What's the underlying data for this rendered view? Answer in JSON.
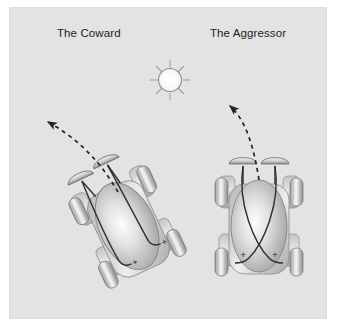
{
  "figure": {
    "kind": "diagram",
    "background_color": "#ffffff",
    "panel_color": "#e3e3e3",
    "panel_border_color": "#dcdcdc",
    "ink_color": "#1d1d1d"
  },
  "labels": {
    "left_vehicle": "The Coward",
    "right_vehicle": "The Aggressor"
  },
  "light_source": {
    "name": "sun",
    "icon": "sun-icon",
    "center_x": 170,
    "center_y": 80,
    "radius": 12,
    "ray_count": 8,
    "fill_color": "#fbfbfb",
    "stroke_color": "#9a9a9a"
  },
  "vehicles": [
    {
      "id": "coward",
      "label": "The Coward",
      "wiring": "uncrossed",
      "wiring_description": "each sensor drives the motor on the same side",
      "rotation_deg": -25,
      "center_x": 128,
      "center_y": 228,
      "body_color_light": "#f2f2f2",
      "body_color_dark": "#9c9c9c",
      "sensor_count": 2,
      "wheel_count": 4,
      "motor_signs": [
        "+",
        "+"
      ],
      "trajectory": "turns away from the light"
    },
    {
      "id": "aggressor",
      "label": "The Aggressor",
      "wiring": "crossed",
      "wiring_description": "each sensor drives the motor on the opposite side",
      "rotation_deg": 0,
      "center_x": 259,
      "center_y": 228,
      "body_color_light": "#f2f2f2",
      "body_color_dark": "#9c9c9c",
      "sensor_count": 2,
      "wheel_count": 4,
      "motor_signs": [
        "+",
        "+"
      ],
      "trajectory": "turns away from the light"
    }
  ],
  "trajectories": [
    {
      "id": "coward-path",
      "style": "dashed",
      "color": "#2a2a2a",
      "arrowhead": "start",
      "direction": "up-and-left",
      "from_x": 120,
      "from_y": 190,
      "to_x": 44,
      "to_y": 121
    },
    {
      "id": "aggressor-path",
      "style": "dashed",
      "color": "#2a2a2a",
      "arrowhead": "start",
      "direction": "up-and-left",
      "from_x": 259,
      "from_y": 190,
      "to_x": 225,
      "to_y": 105
    }
  ],
  "motor_symbols": {
    "plus": "+"
  }
}
